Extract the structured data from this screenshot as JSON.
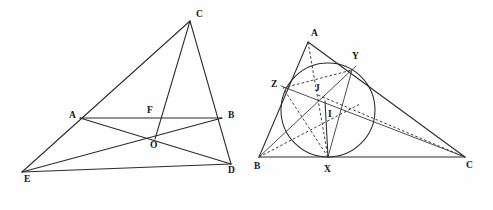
{
  "figure": {
    "background_color": "#fefefe",
    "line_color": "#2b2b2b",
    "width": 493,
    "height": 210
  },
  "left_diagram": {
    "name": "cevian-figure",
    "description": "Triangle with cevians through a common point O and transversal AB",
    "labels": [
      {
        "text": "C",
        "x": 196,
        "y": 10
      },
      {
        "text": "A",
        "x": 69,
        "y": 111
      },
      {
        "text": "F",
        "x": 147,
        "y": 106
      },
      {
        "text": "B",
        "x": 228,
        "y": 111
      },
      {
        "text": "O",
        "x": 150,
        "y": 141
      },
      {
        "text": "D",
        "x": 228,
        "y": 166
      },
      {
        "text": "E",
        "x": 24,
        "y": 175
      }
    ],
    "points": {
      "C": {
        "x": 190,
        "y": 21
      },
      "A": {
        "x": 80,
        "y": 118
      },
      "F": {
        "x": 156,
        "y": 118
      },
      "B": {
        "x": 222,
        "y": 118
      },
      "O": {
        "x": 155,
        "y": 139
      },
      "D": {
        "x": 231,
        "y": 164
      },
      "E": {
        "x": 22,
        "y": 172
      }
    },
    "segments": [
      {
        "name": "segment-C-E",
        "from": "C",
        "to": "E"
      },
      {
        "name": "segment-C-D",
        "from": "C",
        "to": "D"
      },
      {
        "name": "segment-E-D",
        "from": "E",
        "to": "D"
      },
      {
        "name": "segment-A-B",
        "from": "A",
        "to": "B"
      },
      {
        "name": "segment-C-O",
        "from": "C",
        "to": "O"
      },
      {
        "name": "segment-A-D",
        "from": "A",
        "to": "D"
      },
      {
        "name": "segment-B-E",
        "from": "B",
        "to": "E"
      }
    ]
  },
  "right_diagram": {
    "name": "incircle-figure",
    "description": "Triangle ABC with inscribed circle touching at X, Y, Z; incenter I and point J",
    "labels": [
      {
        "text": "A",
        "x": 311,
        "y": 29
      },
      {
        "text": "Y",
        "x": 352,
        "y": 52
      },
      {
        "text": "Z",
        "x": 271,
        "y": 80
      },
      {
        "text": "J",
        "x": 315,
        "y": 84
      },
      {
        "text": "I",
        "x": 328,
        "y": 110
      },
      {
        "text": "B",
        "x": 254,
        "y": 162
      },
      {
        "text": "X",
        "x": 324,
        "y": 165
      },
      {
        "text": "C",
        "x": 466,
        "y": 161
      }
    ],
    "points": {
      "A": {
        "x": 308,
        "y": 42
      },
      "B": {
        "x": 259,
        "y": 157
      },
      "C": {
        "x": 465,
        "y": 157
      },
      "X": {
        "x": 328,
        "y": 157
      },
      "Y": {
        "x": 352,
        "y": 70
      },
      "Z": {
        "x": 283,
        "y": 88
      },
      "I": {
        "x": 325,
        "y": 101
      },
      "J": {
        "x": 318,
        "y": 95
      }
    },
    "incircle": {
      "cx": 328,
      "cy": 110,
      "r": 47
    },
    "segments": [
      {
        "name": "segment-A-B",
        "from": "A",
        "to": "B",
        "style": "solid"
      },
      {
        "name": "segment-A-C",
        "from": "A",
        "to": "C",
        "style": "solid"
      },
      {
        "name": "segment-B-C",
        "from": "B",
        "to": "C",
        "style": "solid"
      },
      {
        "name": "cevian-A-X",
        "from": "A",
        "to": "X",
        "style": "dashed"
      },
      {
        "name": "cevian-B-Y",
        "from": "B",
        "to": "Y",
        "style": "solid"
      },
      {
        "name": "cevian-C-Z",
        "from": "C",
        "to": "Z",
        "style": "solid"
      },
      {
        "name": "chord-Z-Y",
        "from": "Z",
        "to": "Y",
        "style": "dashed"
      },
      {
        "name": "chord-X-Y",
        "from": "X",
        "to": "Y",
        "style": "solid"
      },
      {
        "name": "chord-X-Z",
        "from": "X",
        "to": "Z",
        "style": "dashed"
      },
      {
        "name": "inradius-I-X",
        "from": "I",
        "to": "X",
        "style": "solid"
      }
    ]
  }
}
